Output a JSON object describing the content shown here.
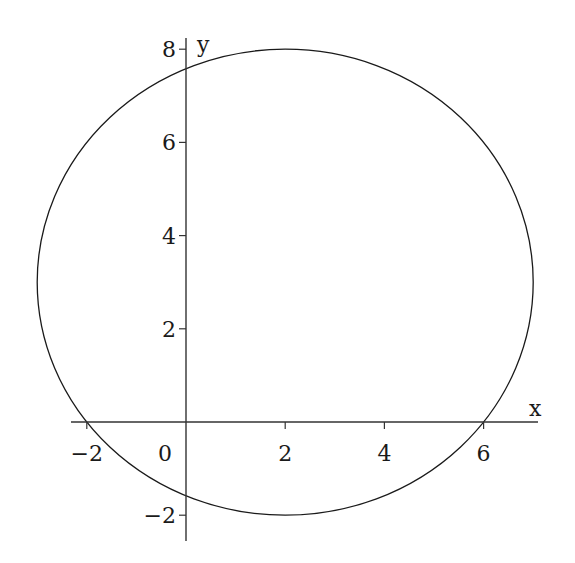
{
  "chart_data": {
    "type": "line",
    "title": "",
    "xlabel": "x",
    "ylabel": "y",
    "xlim": [
      -2.3,
      7.0
    ],
    "ylim": [
      -2.6,
      8.2
    ],
    "grid": false,
    "legend": null,
    "x_ticks": [
      -2,
      0,
      2,
      4,
      6
    ],
    "x_tick_labels": [
      "−2",
      "0",
      "2",
      "4",
      "6"
    ],
    "y_ticks": [
      -2,
      2,
      4,
      6,
      8
    ],
    "y_tick_labels": [
      "−2",
      "2",
      "4",
      "6",
      "8"
    ],
    "series": [
      {
        "name": "circle",
        "equation": "(x - 2)^2 + (y - 3)^2 = 25",
        "center": [
          2,
          3
        ],
        "radius": 5,
        "key_points": {
          "x_intercepts": [
            -2,
            6
          ],
          "y_intercepts": [
            7.58,
            -1.58
          ],
          "top": [
            2,
            8
          ],
          "bottom": [
            2,
            -2
          ],
          "left": [
            -3,
            3
          ],
          "right": [
            7,
            3
          ]
        },
        "color": "#1a1a1a"
      }
    ]
  },
  "axes": {
    "origin_label": "0",
    "x_label": "x",
    "y_label": "y"
  }
}
